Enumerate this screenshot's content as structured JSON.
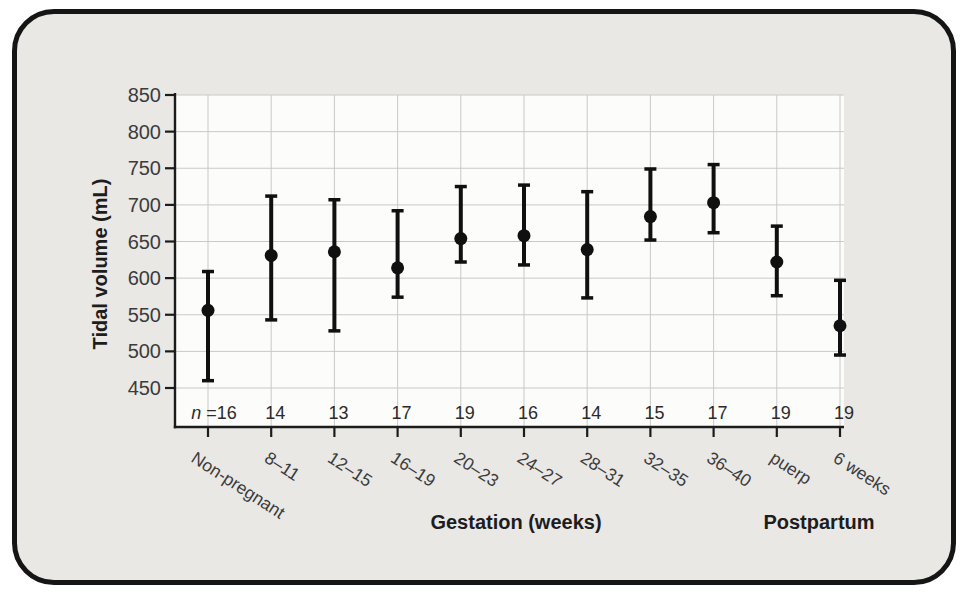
{
  "chart_data": {
    "type": "scatter",
    "subtype": "mean-with-range-error-bars",
    "title": "",
    "ylabel": "Tidal volume (mL)",
    "xlabel_gestation": "Gestation (weeks)",
    "xlabel_postpartum": "Postpartum",
    "ylim": [
      450,
      850
    ],
    "yticks": [
      450,
      500,
      550,
      600,
      650,
      700,
      750,
      800,
      850
    ],
    "grid": true,
    "legend": "none",
    "categories": [
      "Non-pregnant",
      "8–11",
      "12–15",
      "16–19",
      "20–23",
      "24–27",
      "28–31",
      "32–35",
      "36–40",
      "puerp",
      "6 weeks"
    ],
    "n_prefix_italic": "n",
    "n_prefix_rest": " =",
    "n_values": [
      16,
      14,
      13,
      17,
      19,
      16,
      14,
      15,
      17,
      19,
      19
    ],
    "series": [
      {
        "name": "Tidal volume mean",
        "means": [
          556,
          631,
          636,
          614,
          654,
          658,
          639,
          684,
          703,
          622,
          535
        ],
        "upper": [
          609,
          712,
          707,
          692,
          725,
          727,
          718,
          749,
          755,
          671,
          597
        ],
        "lower": [
          460,
          543,
          528,
          574,
          622,
          618,
          573,
          652,
          662,
          576,
          495
        ]
      }
    ],
    "colors": {
      "marker": "#101010",
      "axis": "#1c1c1c",
      "grid": "#c8cac8",
      "tick_text": "#3b3b3b",
      "n_text": "#2b2b2b",
      "frame_fill": "#e9e8e5",
      "frame_border": "#151515",
      "plot_fill": "#fcfcfa",
      "page_bg": "#ffffff"
    }
  }
}
